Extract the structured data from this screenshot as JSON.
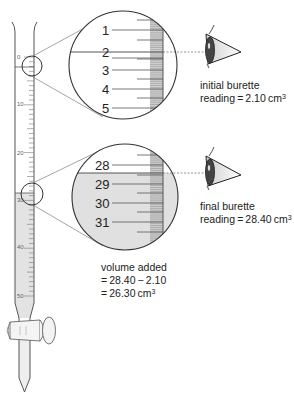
{
  "diagram": {
    "type": "burette-reading",
    "burette": {
      "scale_labels": [
        "0",
        "10",
        "20",
        "30",
        "40",
        "50"
      ],
      "initial_level": 2.1,
      "final_level": 28.4,
      "liquid_color": "#e3e3e3"
    },
    "magnifier_initial": {
      "labels": [
        "1",
        "2",
        "3",
        "4",
        "5"
      ],
      "reading": "2.10"
    },
    "magnifier_final": {
      "labels": [
        "28",
        "29",
        "30",
        "31"
      ],
      "reading": "28.40"
    },
    "annotations": {
      "initial_line1": "initial burette",
      "initial_line2_prefix": "reading = 2.10 cm",
      "initial_line2_sup": "3",
      "final_line1": "final burette",
      "final_line2_prefix": "reading = 28.40 cm",
      "final_line2_sup": "3",
      "volume_line1": "volume added",
      "volume_line2": "= 28.40 − 2.10",
      "volume_line3_prefix": "= 26.30 cm",
      "volume_line3_sup": "3"
    },
    "icons": [
      "eye-icon",
      "eye-icon",
      "stopcock-icon"
    ]
  }
}
